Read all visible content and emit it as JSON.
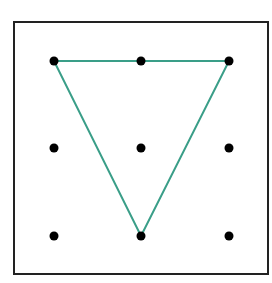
{
  "diagram": {
    "type": "dot-grid",
    "frame": {
      "x": 14,
      "y": 22,
      "width": 254,
      "height": 252,
      "stroke": "#222222"
    },
    "grid": {
      "columns": 3,
      "rows": 3,
      "xs": [
        54,
        141,
        229
      ],
      "ys": [
        61,
        148,
        236
      ],
      "dot_radius": 4.5,
      "dot_color": "#000000"
    },
    "shape": {
      "name": "inverted-triangle",
      "stroke": "#3a9e88",
      "vertices": [
        [
          54,
          61
        ],
        [
          229,
          61
        ],
        [
          141,
          236
        ]
      ]
    }
  }
}
